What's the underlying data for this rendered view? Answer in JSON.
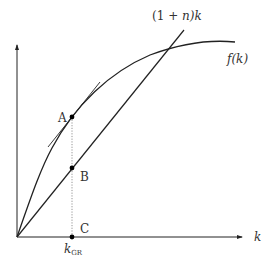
{
  "diagram": {
    "axes": {
      "x_label": "k",
      "y_label": ""
    },
    "curves": {
      "production": {
        "label": "f(k)"
      },
      "line": {
        "label_prefix": "(1 + ",
        "label_var": "n",
        "label_suffix": ")k"
      }
    },
    "points": {
      "A": "A",
      "B": "B",
      "C": "C"
    },
    "x_marker": {
      "main": "k",
      "subscript": "GR"
    },
    "colors": {
      "stroke": "#222222",
      "dotted": "#888888",
      "text": "#333333"
    }
  }
}
